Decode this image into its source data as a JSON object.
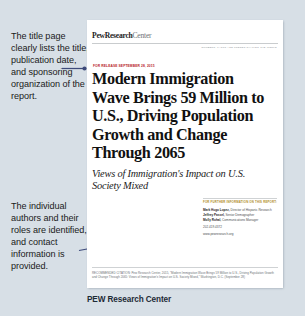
{
  "background_color": "#d7dfe6",
  "accent_color": "#3d4a7a",
  "annotations": [
    {
      "id": "annotation-title-page",
      "text": "The title page clearly lists the title, publication date, and sponsoring organization of the report."
    },
    {
      "id": "annotation-authors",
      "text": "The individual authors and their roles are identified, and contact information is provided."
    }
  ],
  "report": {
    "logo": {
      "bold_part": "PewResearch",
      "light_part": "Center"
    },
    "tagline": "NUMBERS, FACTS AND TRENDS SHAPING THE WORLD",
    "release_date": "FOR RELEASE SEPTEMBER 28, 2015",
    "headline": "Modern Immigration Wave Brings 59 Million to U.S., Driving Population Growth and Change Through 2065",
    "subhead": "Views of Immigration's Impact on U.S. Society Mixed",
    "contact": {
      "heading": "FOR FURTHER INFORMATION ON THIS REPORT:",
      "people": [
        {
          "name": "Mark Hugo Lopez,",
          "role": "Director of Hispanic Research"
        },
        {
          "name": "Jeffrey Passel,",
          "role": "Senior Demographer"
        },
        {
          "name": "Molly Rohal,",
          "role": "Communications Manager"
        }
      ],
      "phone": "202.419.4372",
      "email": "www.pewresearch.org"
    },
    "citation": "RECOMMENDED CITATION: Pew Research Center, 2015, \"Modern Immigration Wave Brings 59 Million to U.S., Driving Population Growth and Change Through 2065: Views of Immigration's Impact on U.S. Society Mixed,\" Washington, D.C. (September 28)"
  },
  "caption": "PEW Research Center"
}
